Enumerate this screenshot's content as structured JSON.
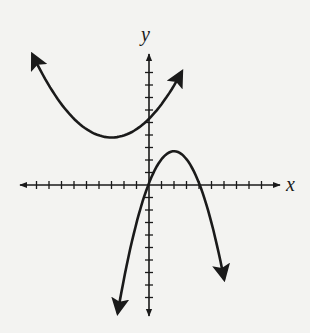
{
  "chart_data": {
    "type": "line",
    "title": "",
    "xlabel": "x",
    "ylabel": "y",
    "xlim": [
      -10,
      10
    ],
    "ylim": [
      -10,
      10
    ],
    "grid": false,
    "ticks": {
      "x_per_side": 9,
      "y_per_side": 9,
      "unit": 1,
      "tick_labels": false
    },
    "series": [
      {
        "name": "upward-parabola",
        "shape": "parabola opening up",
        "vertex": [
          -3,
          3.8
        ],
        "y_intercept": 5,
        "ends": "arrows at both ends",
        "points": [
          [
            -9.3,
            10.4
          ],
          [
            -7,
            7
          ],
          [
            -5,
            4.6
          ],
          [
            -3,
            3.8
          ],
          [
            -1,
            4.4
          ],
          [
            0,
            5
          ],
          [
            1,
            6.4
          ],
          [
            2.6,
            10.4
          ]
        ]
      },
      {
        "name": "downward-parabola",
        "shape": "parabola opening down",
        "vertex": [
          2,
          2.7
        ],
        "x_intercepts": [
          -0.4,
          4.3
        ],
        "ends": "arrows at both ends",
        "points": [
          [
            -2.5,
            -10.2
          ],
          [
            -1.5,
            -4
          ],
          [
            -0.4,
            0
          ],
          [
            0,
            1
          ],
          [
            1,
            2.4
          ],
          [
            2,
            2.7
          ],
          [
            3,
            2.2
          ],
          [
            4.3,
            0
          ],
          [
            5,
            -3
          ],
          [
            6,
            -10
          ]
        ]
      }
    ]
  },
  "labels": {
    "x": "x",
    "y": "y"
  },
  "colors": {
    "background": "#f3f3f1",
    "ink": "#1a1a1a"
  }
}
